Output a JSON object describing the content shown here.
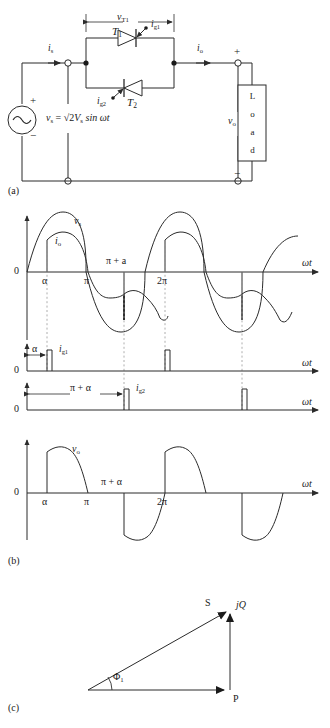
{
  "figure": {
    "parts": [
      {
        "key": "a",
        "label": "(a)",
        "caption_role": "circuit-diagram"
      },
      {
        "key": "b",
        "label": "(b)",
        "caption_role": "waveforms"
      },
      {
        "key": "c",
        "label": "(c)",
        "caption_role": "power-triangle"
      }
    ]
  },
  "circuit": {
    "source": {
      "symbol": "ac-source",
      "plus": "+",
      "minus": "−",
      "equation": "vₛ = √2Vₛ sin ωt",
      "equation_parts": {
        "lhs": "v",
        "lhs_sub": "s",
        "eq": "=",
        "radical": "√2",
        "mag": "V",
        "mag_sub": "s",
        "trig": "sin ωt"
      }
    },
    "currents": [
      {
        "name": "source-current",
        "label": "i",
        "sub": "s"
      },
      {
        "name": "output-current",
        "label": "i",
        "sub": "o"
      }
    ],
    "voltages": [
      {
        "name": "thyristor-voltage",
        "label": "v",
        "sub": "T1"
      },
      {
        "name": "output-voltage",
        "label": "v",
        "sub": "o"
      }
    ],
    "thyristors": [
      {
        "name": "thyristor-t1",
        "label": "T",
        "sub": "1",
        "gate": "i",
        "gate_sub": "g1",
        "direction": "forward"
      },
      {
        "name": "thyristor-t2",
        "label": "T",
        "sub": "2",
        "gate": "i",
        "gate_sub": "g2",
        "direction": "reverse"
      }
    ],
    "load": {
      "label": "Load",
      "letters": [
        "L",
        "o",
        "a",
        "d"
      ]
    },
    "polarity": {
      "plus": "+",
      "minus": "−"
    }
  },
  "waveforms": {
    "axis_label": "ωt",
    "zero_label": "0",
    "plots": [
      {
        "name": "source-voltage-current-plot",
        "traces": [
          {
            "label": "v",
            "sub": "s",
            "kind": "sine"
          },
          {
            "label": "i",
            "sub": "o",
            "kind": "chopped-sine"
          }
        ],
        "x_ticks": [
          {
            "label": "α",
            "position": "alpha"
          },
          {
            "label": "π",
            "position": "pi"
          },
          {
            "label": "π + a",
            "position": "pi-plus-alpha"
          },
          {
            "label": "2π",
            "position": "two-pi"
          }
        ]
      },
      {
        "name": "gate-pulse-ig1-plot",
        "trace": {
          "label": "i",
          "sub": "g1"
        },
        "dimension": {
          "label": "α",
          "from": "0",
          "to": "alpha"
        },
        "zero_label": "0"
      },
      {
        "name": "gate-pulse-ig2-plot",
        "trace": {
          "label": "i",
          "sub": "g2"
        },
        "dimension": {
          "label": "π + α",
          "from": "0",
          "to": "pi-plus-alpha"
        },
        "zero_label": "0"
      },
      {
        "name": "output-voltage-plot",
        "trace": {
          "label": "v",
          "sub": "o",
          "kind": "phase-controlled"
        },
        "x_ticks": [
          {
            "label": "α",
            "position": "alpha"
          },
          {
            "label": "π",
            "position": "pi"
          },
          {
            "label": "π + α",
            "position": "pi-plus-alpha"
          },
          {
            "label": "2π",
            "position": "two-pi"
          }
        ]
      }
    ]
  },
  "power_triangle": {
    "vertices": {
      "apparent": "S",
      "real": "P",
      "reactive": "jQ"
    },
    "angle": {
      "label": "Φ",
      "sub": "1"
    }
  },
  "colors": {
    "line": "#2b2b2b",
    "text": "#1a1a1a",
    "dashed": "#9a9a9a",
    "background": "#ffffff"
  }
}
